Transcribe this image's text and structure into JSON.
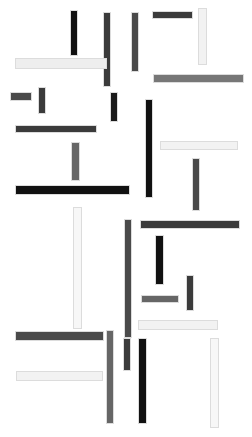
{
  "artwork": {
    "title": "Abstract Orthogonal Bar Composition",
    "width": 252,
    "height": 437,
    "background_color": "#ffffff",
    "palette": {
      "black": "#111111",
      "near_black": "#1a1a1a",
      "dark_gray": "#3b3b3b",
      "mid_dark_gray": "#4a4a4a",
      "mid_gray": "#666666",
      "gray": "#777777",
      "light_gray": "#eeeeee",
      "off_white": "#f2f2f2",
      "white_bar": "#f7f7f7",
      "bar_border": "#dcdcdc"
    }
  },
  "chart_data": {
    "type": "scatter",
    "xlabel": "",
    "ylabel": "",
    "xlim": [
      0,
      252
    ],
    "ylim": [
      0,
      437
    ],
    "grid": false,
    "legend": null,
    "bars": [
      {
        "id": "bar-01",
        "orientation": "vertical",
        "x": 70,
        "y": 10,
        "w": 8,
        "h": 46,
        "fill": "#111111",
        "border": "#dcdcdc"
      },
      {
        "id": "bar-02",
        "orientation": "vertical",
        "x": 103,
        "y": 12,
        "w": 8,
        "h": 75,
        "fill": "#3b3b3b",
        "border": "#dcdcdc"
      },
      {
        "id": "bar-03",
        "orientation": "horizontal",
        "x": 152,
        "y": 11,
        "w": 41,
        "h": 8,
        "fill": "#3b3b3b",
        "border": "#dcdcdc"
      },
      {
        "id": "bar-04",
        "orientation": "vertical",
        "x": 198,
        "y": 8,
        "w": 9,
        "h": 57,
        "fill": "#f2f2f2",
        "border": "#dcdcdc"
      },
      {
        "id": "bar-05",
        "orientation": "vertical",
        "x": 131,
        "y": 12,
        "w": 8,
        "h": 60,
        "fill": "#4a4a4a",
        "border": "#dcdcdc"
      },
      {
        "id": "bar-06",
        "orientation": "horizontal",
        "x": 15,
        "y": 58,
        "w": 92,
        "h": 11,
        "fill": "#eeeeee",
        "border": "#dcdcdc"
      },
      {
        "id": "bar-07",
        "orientation": "horizontal",
        "x": 153,
        "y": 74,
        "w": 91,
        "h": 9,
        "fill": "#777777",
        "border": "#dcdcdc"
      },
      {
        "id": "bar-08",
        "orientation": "vertical",
        "x": 38,
        "y": 87,
        "w": 8,
        "h": 27,
        "fill": "#3b3b3b",
        "border": "#dcdcdc"
      },
      {
        "id": "bar-09",
        "orientation": "horizontal",
        "x": 10,
        "y": 92,
        "w": 22,
        "h": 9,
        "fill": "#4a4a4a",
        "border": "#dcdcdc"
      },
      {
        "id": "bar-10",
        "orientation": "vertical",
        "x": 110,
        "y": 92,
        "w": 8,
        "h": 30,
        "fill": "#1a1a1a",
        "border": "#dcdcdc"
      },
      {
        "id": "bar-11",
        "orientation": "vertical",
        "x": 145,
        "y": 99,
        "w": 8,
        "h": 99,
        "fill": "#111111",
        "border": "#dcdcdc"
      },
      {
        "id": "bar-12",
        "orientation": "horizontal",
        "x": 15,
        "y": 125,
        "w": 82,
        "h": 8,
        "fill": "#3b3b3b",
        "border": "#dcdcdc"
      },
      {
        "id": "bar-13",
        "orientation": "horizontal",
        "x": 160,
        "y": 141,
        "w": 78,
        "h": 9,
        "fill": "#f2f2f2",
        "border": "#dcdcdc"
      },
      {
        "id": "bar-14",
        "orientation": "vertical",
        "x": 71,
        "y": 142,
        "w": 9,
        "h": 39,
        "fill": "#666666",
        "border": "#dcdcdc"
      },
      {
        "id": "bar-15",
        "orientation": "vertical",
        "x": 192,
        "y": 158,
        "w": 8,
        "h": 53,
        "fill": "#4a4a4a",
        "border": "#dcdcdc"
      },
      {
        "id": "bar-16",
        "orientation": "horizontal",
        "x": 15,
        "y": 185,
        "w": 115,
        "h": 10,
        "fill": "#111111",
        "border": "#dcdcdc"
      },
      {
        "id": "bar-17",
        "orientation": "vertical",
        "x": 73,
        "y": 207,
        "w": 9,
        "h": 122,
        "fill": "#f7f7f7",
        "border": "#dcdcdc"
      },
      {
        "id": "bar-18",
        "orientation": "vertical",
        "x": 124,
        "y": 219,
        "w": 8,
        "h": 119,
        "fill": "#4a4a4a",
        "border": "#dcdcdc"
      },
      {
        "id": "bar-19",
        "orientation": "horizontal",
        "x": 140,
        "y": 220,
        "w": 100,
        "h": 9,
        "fill": "#3b3b3b",
        "border": "#dcdcdc"
      },
      {
        "id": "bar-20",
        "orientation": "vertical",
        "x": 155,
        "y": 235,
        "w": 9,
        "h": 50,
        "fill": "#111111",
        "border": "#dcdcdc"
      },
      {
        "id": "bar-21",
        "orientation": "vertical",
        "x": 186,
        "y": 275,
        "w": 8,
        "h": 36,
        "fill": "#3b3b3b",
        "border": "#dcdcdc"
      },
      {
        "id": "bar-22",
        "orientation": "horizontal",
        "x": 141,
        "y": 295,
        "w": 38,
        "h": 8,
        "fill": "#666666",
        "border": "#dcdcdc"
      },
      {
        "id": "bar-23",
        "orientation": "horizontal",
        "x": 138,
        "y": 320,
        "w": 80,
        "h": 10,
        "fill": "#f2f2f2",
        "border": "#dcdcdc"
      },
      {
        "id": "bar-24",
        "orientation": "vertical",
        "x": 106,
        "y": 330,
        "w": 8,
        "h": 94,
        "fill": "#666666",
        "border": "#dcdcdc"
      },
      {
        "id": "bar-25",
        "orientation": "horizontal",
        "x": 15,
        "y": 331,
        "w": 89,
        "h": 10,
        "fill": "#4a4a4a",
        "border": "#dcdcdc"
      },
      {
        "id": "bar-26",
        "orientation": "vertical",
        "x": 123,
        "y": 338,
        "w": 8,
        "h": 33,
        "fill": "#3b3b3b",
        "border": "#dcdcdc"
      },
      {
        "id": "bar-27",
        "orientation": "vertical",
        "x": 138,
        "y": 338,
        "w": 9,
        "h": 86,
        "fill": "#111111",
        "border": "#dcdcdc"
      },
      {
        "id": "bar-28",
        "orientation": "vertical",
        "x": 210,
        "y": 338,
        "w": 9,
        "h": 90,
        "fill": "#f7f7f7",
        "border": "#dcdcdc"
      },
      {
        "id": "bar-29",
        "orientation": "horizontal",
        "x": 16,
        "y": 371,
        "w": 87,
        "h": 10,
        "fill": "#f2f2f2",
        "border": "#dcdcdc"
      }
    ]
  }
}
